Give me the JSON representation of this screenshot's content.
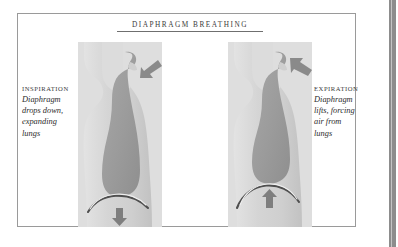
{
  "plate": {
    "title": "DIAPHRAGM BREATHING",
    "border_color": "#9a9a9a",
    "background_color": "#ffffff",
    "edge_band_color": "#8d8d8d"
  },
  "palette": {
    "body_light": "#d8d8d8",
    "body_mid": "#c6c6c6",
    "body_shadow": "#bdbdbd",
    "airway_dark": "#9a9a9a",
    "airway_mid": "#ababab",
    "diaphragm_line": "#4a4a4a",
    "arrow": "#7d7d7d",
    "text": "#2c2c2c",
    "panel_bg": "#dcdcdc"
  },
  "figures": [
    {
      "id": "inspiration",
      "caption": {
        "heading": "INSPIRATION",
        "lines": [
          "Diaphragm",
          "drops down,",
          "expanding",
          "lungs"
        ]
      },
      "airflow_arrow": {
        "name": "air-in-arrow",
        "direction": "into-nose",
        "label": "air in"
      },
      "diaphragm_arrow": {
        "name": "diaphragm-down-arrow",
        "direction": "down",
        "label": "diaphragm drops"
      },
      "diaphragm_shape": "flattened-low-arch"
    },
    {
      "id": "expiration",
      "caption": {
        "heading": "EXPIRATION",
        "lines": [
          "Diaphragm",
          "lifts, forcing",
          "air from",
          "lungs"
        ]
      },
      "airflow_arrow": {
        "name": "air-out-arrow",
        "direction": "out-of-nose",
        "label": "air out"
      },
      "diaphragm_arrow": {
        "name": "diaphragm-up-arrow",
        "direction": "up",
        "label": "diaphragm lifts"
      },
      "diaphragm_shape": "raised-dome-arch"
    }
  ]
}
